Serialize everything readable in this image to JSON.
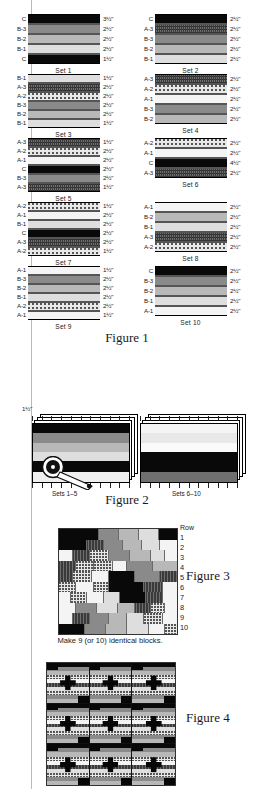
{
  "figure1": {
    "caption": "Figure 1",
    "sets": [
      {
        "name": "Set 1",
        "strips": [
          {
            "label": "C",
            "fabric": "C",
            "dim": "3½\""
          },
          {
            "label": "B-3",
            "fabric": "B3",
            "dim": "2½\""
          },
          {
            "label": "B-2",
            "fabric": "B2",
            "dim": "2½\""
          },
          {
            "label": "B-1",
            "fabric": "B1",
            "dim": "2½\""
          },
          {
            "label": "C",
            "fabric": "C",
            "dim": "1½\""
          }
        ]
      },
      {
        "name": "Set 2",
        "strips": [
          {
            "label": "C",
            "fabric": "C",
            "dim": "2½\""
          },
          {
            "label": "A-3",
            "fabric": "A3",
            "dim": "2½\""
          },
          {
            "label": "B-3",
            "fabric": "B3",
            "dim": "2½\""
          },
          {
            "label": "B-2",
            "fabric": "B2",
            "dim": "2½\""
          },
          {
            "label": "B-1",
            "fabric": "B1",
            "dim": "2½\""
          }
        ]
      },
      {
        "name": "Set 3",
        "strips": [
          {
            "label": "B-1",
            "fabric": "B1",
            "dim": "1½\""
          },
          {
            "label": "A-3",
            "fabric": "A3",
            "dim": "2½\""
          },
          {
            "label": "A-2",
            "fabric": "A2",
            "dim": "2½\""
          },
          {
            "label": "B-3",
            "fabric": "B3",
            "dim": "2½\""
          },
          {
            "label": "B-2",
            "fabric": "B2",
            "dim": "2½\""
          },
          {
            "label": "B-1",
            "fabric": "B1",
            "dim": "1½\""
          }
        ]
      },
      {
        "name": "Set 4",
        "strips": [
          {
            "label": "A-3",
            "fabric": "A3",
            "dim": "2½\""
          },
          {
            "label": "A-2",
            "fabric": "A2",
            "dim": "2½\""
          },
          {
            "label": "A-1",
            "fabric": "A1",
            "dim": "2½\""
          },
          {
            "label": "B-3",
            "fabric": "B3",
            "dim": "2½\""
          },
          {
            "label": "B-2",
            "fabric": "B2",
            "dim": "2½\""
          }
        ]
      },
      {
        "name": "Set 5",
        "strips": [
          {
            "label": "A-3",
            "fabric": "A3",
            "dim": "1½\""
          },
          {
            "label": "A-2",
            "fabric": "A2",
            "dim": "2½\""
          },
          {
            "label": "A-1",
            "fabric": "A1",
            "dim": "2½\""
          },
          {
            "label": "C",
            "fabric": "C",
            "dim": "2½\""
          },
          {
            "label": "B-3",
            "fabric": "B3",
            "dim": "2½\""
          },
          {
            "label": "A-3",
            "fabric": "A3",
            "dim": "1½\""
          }
        ]
      },
      {
        "name": "Set 6",
        "strips": [
          {
            "label": "A-2",
            "fabric": "A2",
            "dim": "2½\""
          },
          {
            "label": "A-1",
            "fabric": "A1",
            "dim": "2½\""
          },
          {
            "label": "C",
            "fabric": "C",
            "dim": "4½\""
          },
          {
            "label": "A-3",
            "fabric": "A3",
            "dim": "2½\""
          }
        ]
      },
      {
        "name": "Set 7",
        "strips": [
          {
            "label": "A-2",
            "fabric": "A2",
            "dim": "1½\""
          },
          {
            "label": "A-1",
            "fabric": "A1",
            "dim": "2½\""
          },
          {
            "label": "B-1",
            "fabric": "B1",
            "dim": "2½\""
          },
          {
            "label": "C",
            "fabric": "C",
            "dim": "2½\""
          },
          {
            "label": "A-3",
            "fabric": "A3",
            "dim": "2½\""
          },
          {
            "label": "A-2",
            "fabric": "A2",
            "dim": "1½\""
          }
        ]
      },
      {
        "name": "Set 8",
        "strips": [
          {
            "label": "A-1",
            "fabric": "A1",
            "dim": "2½\""
          },
          {
            "label": "B-2",
            "fabric": "B2",
            "dim": "2½\""
          },
          {
            "label": "B-1",
            "fabric": "B1",
            "dim": "2½\""
          },
          {
            "label": "A-3",
            "fabric": "A3",
            "dim": "2½\""
          },
          {
            "label": "A-2",
            "fabric": "A2",
            "dim": "2½\""
          }
        ]
      },
      {
        "name": "Set 9",
        "strips": [
          {
            "label": "A-1",
            "fabric": "A1",
            "dim": "1½\""
          },
          {
            "label": "B-3",
            "fabric": "B3",
            "dim": "2½\""
          },
          {
            "label": "B-2",
            "fabric": "B2",
            "dim": "2½\""
          },
          {
            "label": "B-1",
            "fabric": "B1",
            "dim": "2½\""
          },
          {
            "label": "A-2",
            "fabric": "A2",
            "dim": "2½\""
          },
          {
            "label": "A-1",
            "fabric": "A1",
            "dim": "1½\""
          }
        ]
      },
      {
        "name": "Set 10",
        "strips": [
          {
            "label": "C",
            "fabric": "C",
            "dim": "2½\""
          },
          {
            "label": "B-3",
            "fabric": "B3",
            "dim": "2½\""
          },
          {
            "label": "B-2",
            "fabric": "B2",
            "dim": "2½\""
          },
          {
            "label": "B-1",
            "fabric": "B1",
            "dim": "2½\""
          },
          {
            "label": "A-1",
            "fabric": "A1",
            "dim": "2½\""
          }
        ]
      }
    ]
  },
  "figure2": {
    "caption": "Figure 2",
    "cut_width": "1½\"",
    "left_label": "Sets 1–5",
    "right_label": "Sets 6–10",
    "tool": "rotary-cutter"
  },
  "figure3": {
    "caption": "Figure 3",
    "row_header": "Row",
    "row_numbers": [
      "1",
      "2",
      "3",
      "4",
      "5",
      "6",
      "7",
      "8",
      "9",
      "10"
    ],
    "note": "Make 9 (or 10) identical blocks."
  },
  "figure4": {
    "caption": "Figure 4",
    "blocks_across": 3,
    "blocks_down": 3
  },
  "colors": {
    "fabric_C": "#090909",
    "fabric_B3": "#8a8a8a",
    "fabric_B2": "#b8b8b8",
    "fabric_B1": "#dedede",
    "fabric_A3": "#6f6f6f",
    "fabric_A2": "#e8e8e8",
    "fabric_A1": "#f4f4f4",
    "page_rule": "#b9b9b9"
  },
  "chart_data": {
    "type": "table",
    "columns": [
      "Set",
      "Strip order (top to bottom)",
      "Cut widths"
    ],
    "rows": [
      [
        "Set 1",
        "C, B-3, B-2, B-1, C",
        "3½\", 2½\", 2½\", 2½\", 1½\""
      ],
      [
        "Set 2",
        "C, A-3, B-3, B-2, B-1",
        "2½\", 2½\", 2½\", 2½\", 2½\""
      ],
      [
        "Set 3",
        "B-1, A-3, A-2, B-3, B-2, B-1",
        "1½\", 2½\", 2½\", 2½\", 2½\", 1½\""
      ],
      [
        "Set 4",
        "A-3, A-2, A-1, B-3, B-2",
        "2½\", 2½\", 2½\", 2½\", 2½\""
      ],
      [
        "Set 5",
        "A-3, A-2, A-1, C, B-3, A-3",
        "1½\", 2½\", 2½\", 2½\", 2½\", 1½\""
      ],
      [
        "Set 6",
        "A-2, A-1, C, A-3",
        "2½\", 2½\", 4½\", 2½\""
      ],
      [
        "Set 7",
        "A-2, A-1, B-1, C, A-3, A-2",
        "1½\", 2½\", 2½\", 2½\", 2½\", 1½\""
      ],
      [
        "Set 8",
        "A-1, B-2, B-1, A-3, A-2",
        "2½\", 2½\", 2½\", 2½\", 2½\""
      ],
      [
        "Set 9",
        "A-1, B-3, B-2, B-1, A-2, A-1",
        "1½\", 2½\", 2½\", 2½\", 2½\", 1½\""
      ],
      [
        "Set 10",
        "C, B-3, B-2, B-1, A-1",
        "2½\", 2½\", 2½\", 2½\", 2½\""
      ]
    ],
    "xlabel": "",
    "ylabel": ""
  }
}
